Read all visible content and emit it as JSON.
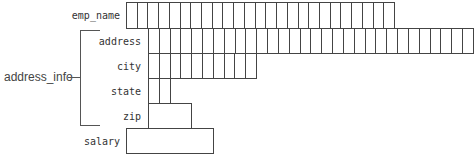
{
  "diagram": {
    "group_label": "address_info",
    "fields": [
      {
        "name": "emp_name",
        "cells": 25,
        "x": 126,
        "y": 2,
        "w": 269,
        "h": 26,
        "label_y": 10
      },
      {
        "name": "address",
        "cells": 30,
        "x": 148,
        "y": 28,
        "w": 325,
        "h": 25,
        "label_y": 36
      },
      {
        "name": "city",
        "cells": 10,
        "x": 148,
        "y": 53,
        "w": 108,
        "h": 25,
        "label_y": 61
      },
      {
        "name": "state",
        "cells": 2,
        "x": 148,
        "y": 78,
        "w": 22,
        "h": 25,
        "label_y": 86
      },
      {
        "name": "zip",
        "cells": 1,
        "x": 148,
        "y": 103,
        "w": 43,
        "h": 25,
        "label_y": 111
      },
      {
        "name": "salary",
        "cells": 1,
        "x": 126,
        "y": 128,
        "w": 87,
        "h": 25,
        "label_y": 136
      }
    ]
  }
}
